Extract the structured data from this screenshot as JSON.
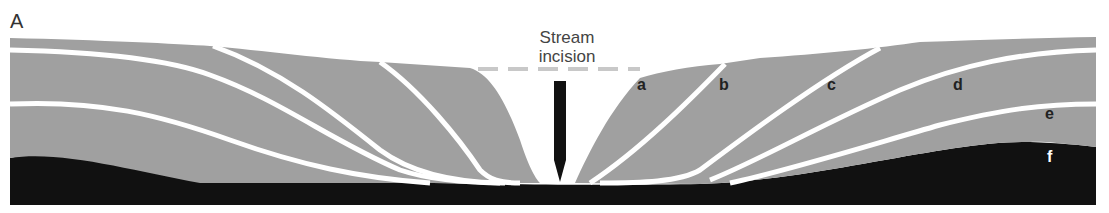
{
  "figure": {
    "panel_label": "A",
    "caption_line1": "Stream",
    "caption_line2": "incision",
    "colors": {
      "strata": "#a0a0a0",
      "bedrock": "#111111",
      "contacts": "#ffffff",
      "background": "#ffffff"
    },
    "unit_labels": [
      {
        "id": "a",
        "text": "a"
      },
      {
        "id": "b",
        "text": "b"
      },
      {
        "id": "c",
        "text": "c"
      },
      {
        "id": "d",
        "text": "d"
      },
      {
        "id": "e",
        "text": "e"
      },
      {
        "id": "f",
        "text": "f"
      }
    ]
  }
}
